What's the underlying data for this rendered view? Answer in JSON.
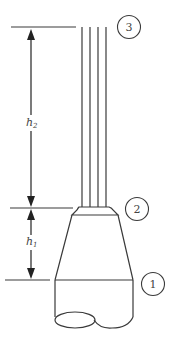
{
  "diagram": {
    "type": "nozzle-jet-schematic",
    "stroke_color": "#3a3a3a",
    "background": "#ffffff",
    "dimensions": [
      {
        "id": "h2",
        "label_base": "h",
        "label_sub": "2",
        "from_station": "2",
        "to_station": "3"
      },
      {
        "id": "h1",
        "label_base": "h",
        "label_sub": "1",
        "from_station": "1",
        "to_station": "2"
      }
    ],
    "stations": [
      {
        "id": "3",
        "label": "3"
      },
      {
        "id": "2",
        "label": "2"
      },
      {
        "id": "1",
        "label": "1"
      }
    ],
    "jet_streams": 4
  }
}
